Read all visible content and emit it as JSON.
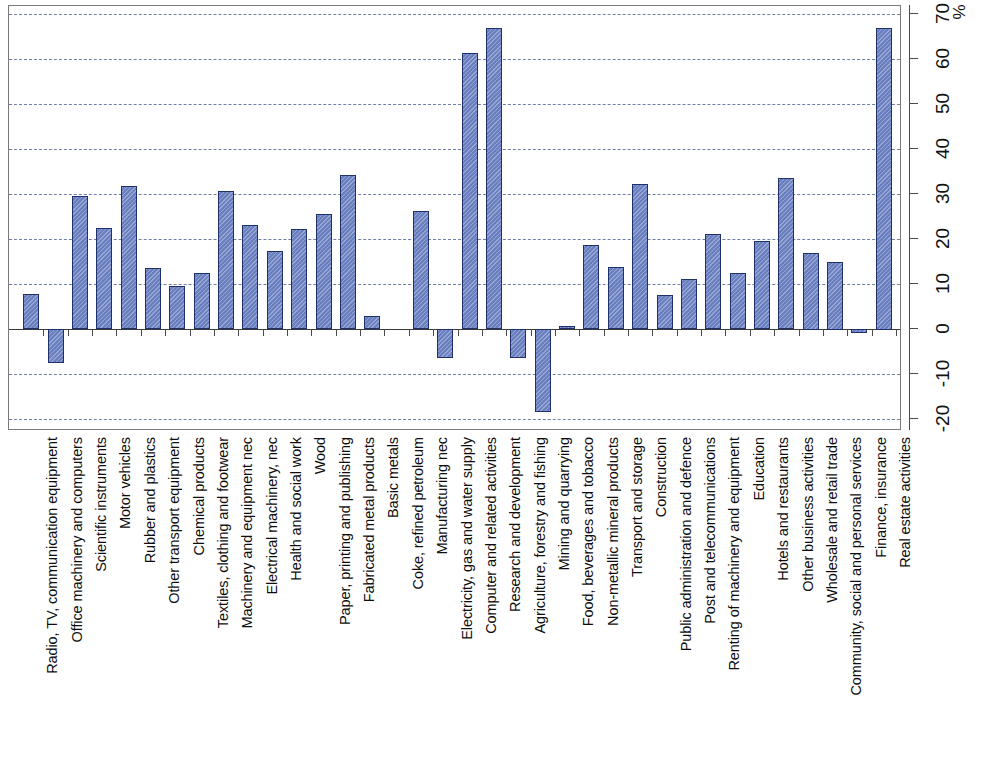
{
  "chart_data": {
    "type": "bar",
    "title": "",
    "subtitle": "",
    "xlabel": "",
    "ylabel": "",
    "unit_label": "%",
    "orientation": "vertical-bars-rotated-labels",
    "grid": true,
    "legend": null,
    "ylim": [
      -20,
      70
    ],
    "ytick_step": 10,
    "yticks": [
      "-20",
      "-10",
      "0",
      "10",
      "20",
      "30",
      "40",
      "50",
      "60",
      "70"
    ],
    "categories": [
      "Radio, TV, communication equipment",
      "Office machinery and computers",
      "Scientific instruments",
      "Motor vehicles",
      "Rubber and plastics",
      "Other transport equipment",
      "Chemical products",
      "Textiles, clothing and footwear",
      "Machinery and equipment nec",
      "Electrical machinery, nec",
      "Health and social work",
      "Wood",
      "Paper, printing and publishing",
      "Fabricated metal products",
      "Basic metals",
      "Coke, refined petroleum",
      "Manufacturing nec",
      "Electricity, gas and water supply",
      "Computer and related activities",
      "Research and development",
      "Agriculture, forestry and fishing",
      "Mining and quarrying",
      "Food, beverages and tobacco",
      "Non-metallic mineral products",
      "Transport and storage",
      "Construction",
      "Public administration and defence",
      "Post and telecommunications",
      "Renting of machinery and equipment",
      "Education",
      "Hotels and restaurants",
      "Other business activities",
      "Wholesale and retail trade",
      "Community, social and personal services",
      "Finance, insurance",
      "Real estate activities"
    ],
    "values": [
      7.8,
      -7.5,
      29.5,
      22.5,
      31.8,
      13.5,
      9.5,
      12.5,
      30.6,
      23.2,
      17.3,
      22.3,
      25.5,
      34.2,
      2.8,
      0,
      26.3,
      -6.5,
      61.3,
      66.8,
      -6.5,
      -18.5,
      0.6,
      18.6,
      13.8,
      32.2,
      7.6,
      11.2,
      21.2,
      12.4,
      19.6,
      33.6,
      17.0,
      15.0,
      -0.8,
      67.0
    ],
    "bar_color": "#6a7fc0",
    "bar_border_color": "#20306b",
    "grid_color": "#6f7fa6",
    "frame_color": "#7a7a7a"
  },
  "axis": {
    "unit": "%"
  }
}
